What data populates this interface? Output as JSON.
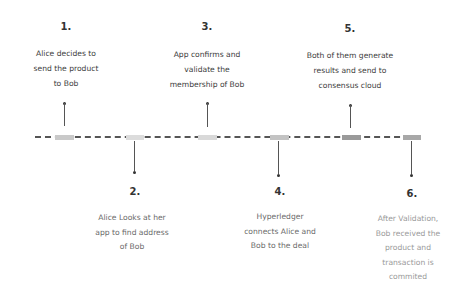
{
  "timeline": {
    "line_color": "#555555",
    "segments": [
      {
        "x": 55,
        "width": 19,
        "color": "#c9c9c9"
      },
      {
        "x": 126,
        "width": 18,
        "color": "#dcdcdc"
      },
      {
        "x": 198,
        "width": 19,
        "color": "#d9d9d9"
      },
      {
        "x": 270,
        "width": 19,
        "color": "#c3c3c3"
      },
      {
        "x": 342,
        "width": 19,
        "color": "#9a9a9a"
      },
      {
        "x": 403,
        "width": 18,
        "color": "#a8a8a8"
      }
    ]
  },
  "steps": [
    {
      "number": "1.",
      "text_lines": [
        "Alice decides to",
        "send the product",
        "to Bob"
      ],
      "position": "top"
    },
    {
      "number": "2.",
      "text_lines": [
        "Alice Looks at her",
        "app to find address",
        "of Bob"
      ],
      "position": "bottom"
    },
    {
      "number": "3.",
      "text_lines": [
        "App confirms and",
        "validate the",
        "membership of Bob"
      ],
      "position": "top"
    },
    {
      "number": "4.",
      "text_lines": [
        "Hyperledger",
        "connects Alice and",
        "Bob to the deal"
      ],
      "position": "bottom"
    },
    {
      "number": "5.",
      "text_lines": [
        "Both of them generate",
        "results and send to",
        "consensus cloud"
      ],
      "position": "top"
    },
    {
      "number": "6.",
      "text_lines": [
        "After Validation,",
        "Bob received the",
        "product and",
        "transaction is",
        "commited"
      ],
      "position": "bottom"
    }
  ]
}
